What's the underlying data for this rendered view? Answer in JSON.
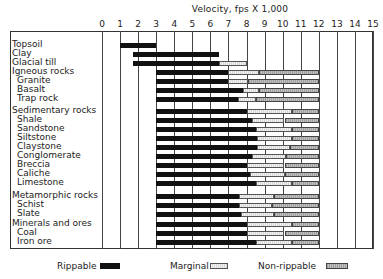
{
  "chart_data": {
    "type": "bar",
    "orientation": "horizontal-stacked-range",
    "title": "Velocity, fps X 1,000",
    "xlabel": "Velocity, fps X 1,000",
    "ylabel": "",
    "xlim": [
      0,
      15
    ],
    "x_ticks": [
      "0",
      "1",
      "2",
      "3",
      "4",
      "5",
      "6",
      "7",
      "8",
      "9",
      "10",
      "11",
      "12",
      "13",
      "14",
      "15"
    ],
    "grid": true,
    "legend": [
      {
        "name": "Rippable",
        "color": "#111111"
      },
      {
        "name": "Marginal",
        "color": "#e4e4e4"
      },
      {
        "name": "Non-rippable",
        "color": "#a8a8a8"
      }
    ],
    "legend_position": "bottom",
    "rows": [
      {
        "label": "Topsoil",
        "indent": false,
        "rippable": [
          1,
          3
        ],
        "marginal": null,
        "non_rippable": null
      },
      {
        "label": "Clay",
        "indent": false,
        "rippable": [
          1.7,
          6.5
        ],
        "marginal": null,
        "non_rippable": null
      },
      {
        "label": "Glacial till",
        "indent": false,
        "rippable": [
          1.7,
          6.5
        ],
        "marginal": [
          6.5,
          8.0
        ],
        "non_rippable": null
      },
      {
        "label": "Igneous rocks",
        "indent": false,
        "rippable": [
          3,
          7.0
        ],
        "marginal": [
          7.0,
          8.7
        ],
        "non_rippable": [
          8.7,
          12
        ]
      },
      {
        "label": "Granite",
        "indent": true,
        "rippable": [
          3,
          7.0
        ],
        "marginal": [
          7.0,
          8.1
        ],
        "non_rippable": [
          8.1,
          12
        ]
      },
      {
        "label": "Basalt",
        "indent": true,
        "rippable": [
          3,
          7.8
        ],
        "marginal": [
          7.8,
          8.7
        ],
        "non_rippable": [
          8.7,
          12
        ]
      },
      {
        "label": "Trap rock",
        "indent": true,
        "rippable": [
          3,
          7.5
        ],
        "marginal": [
          7.5,
          8.5
        ],
        "non_rippable": [
          8.5,
          12
        ]
      },
      {
        "label": "Sedimentary rocks",
        "indent": false,
        "rippable": [
          3,
          8.0
        ],
        "marginal": [
          8.0,
          10.5
        ],
        "non_rippable": [
          10.5,
          12
        ]
      },
      {
        "label": "Shale",
        "indent": true,
        "rippable": [
          3,
          8.3
        ],
        "marginal": [
          8.3,
          10.1
        ],
        "non_rippable": [
          10.1,
          12
        ]
      },
      {
        "label": "Sandstone",
        "indent": true,
        "rippable": [
          3,
          8.5
        ],
        "marginal": [
          8.5,
          10.5
        ],
        "non_rippable": [
          10.5,
          12
        ]
      },
      {
        "label": "Siltstone",
        "indent": true,
        "rippable": [
          3,
          8.6
        ],
        "marginal": [
          8.6,
          10.5
        ],
        "non_rippable": [
          10.5,
          12
        ]
      },
      {
        "label": "Claystone",
        "indent": true,
        "rippable": [
          3,
          8.6
        ],
        "marginal": [
          8.6,
          10.4
        ],
        "non_rippable": [
          10.4,
          12
        ]
      },
      {
        "label": "Conglomerate",
        "indent": true,
        "rippable": [
          3,
          8.3
        ],
        "marginal": [
          8.3,
          10.2
        ],
        "non_rippable": [
          10.2,
          12
        ]
      },
      {
        "label": "Breccia",
        "indent": true,
        "rippable": [
          3,
          8.0
        ],
        "marginal": [
          8.0,
          10.1
        ],
        "non_rippable": [
          10.1,
          12
        ]
      },
      {
        "label": "Caliche",
        "indent": true,
        "rippable": [
          3,
          8.2
        ],
        "marginal": [
          8.2,
          10.1
        ],
        "non_rippable": [
          10.1,
          12
        ]
      },
      {
        "label": "Limestone",
        "indent": true,
        "rippable": [
          3,
          8.5
        ],
        "marginal": [
          8.5,
          10.5
        ],
        "non_rippable": [
          10.5,
          12
        ]
      },
      {
        "label": "Metamorphic rocks",
        "indent": false,
        "rippable": [
          3,
          7.6
        ],
        "marginal": [
          7.6,
          9.5
        ],
        "non_rippable": [
          9.5,
          12
        ]
      },
      {
        "label": "Schist",
        "indent": true,
        "rippable": [
          3,
          7.6
        ],
        "marginal": [
          7.6,
          9.4
        ],
        "non_rippable": [
          9.4,
          12
        ]
      },
      {
        "label": "Slate",
        "indent": true,
        "rippable": [
          3,
          7.7
        ],
        "marginal": [
          7.7,
          9.5
        ],
        "non_rippable": [
          9.5,
          12
        ]
      },
      {
        "label": "Minerals and ores",
        "indent": false,
        "rippable": [
          3,
          8.0
        ],
        "marginal": [
          8.0,
          10.5
        ],
        "non_rippable": [
          10.5,
          12
        ]
      },
      {
        "label": "Coal",
        "indent": true,
        "rippable": [
          3,
          8.0
        ],
        "marginal": [
          8.0,
          10.1
        ],
        "non_rippable": [
          10.1,
          12
        ]
      },
      {
        "label": "Iron ore",
        "indent": true,
        "rippable": [
          3,
          8.5
        ],
        "marginal": [
          8.5,
          10.5
        ],
        "non_rippable": [
          10.5,
          12
        ]
      }
    ]
  },
  "legend": {
    "rippable_label": "Rippable",
    "marginal_label": "Marginal",
    "non_rippable_label": "Non-rippable"
  }
}
